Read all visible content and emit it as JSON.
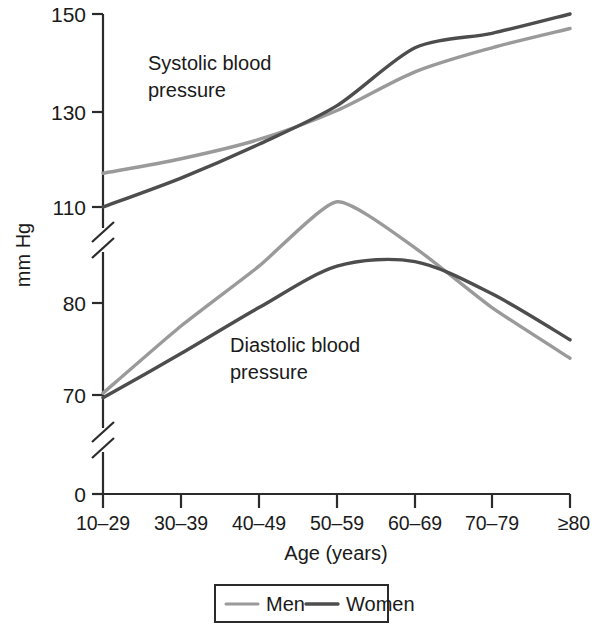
{
  "chart_data": {
    "type": "line",
    "title": "",
    "xlabel": "Age (years)",
    "ylabel": "mm Hg",
    "grid": false,
    "legend_position": "bottom-center",
    "categories": [
      "10–29",
      "30–39",
      "40–49",
      "50–59",
      "60–69",
      "70–79",
      "≥80"
    ],
    "y_tick_labels": [
      "150",
      "130",
      "110",
      "80",
      "70",
      "0"
    ],
    "y_ticks": [
      150,
      130,
      110,
      80,
      70,
      0
    ],
    "axis_breaks": 2,
    "annotations": [
      {
        "text": "Systolic blood pressure",
        "line1": "Systolic blood",
        "line2": "pressure"
      },
      {
        "text": "Diastolic blood pressure",
        "line1": "Diastolic blood",
        "line2": "pressure"
      }
    ],
    "panels": [
      {
        "name": "Systolic blood pressure",
        "series": [
          {
            "name": "Men",
            "color": "#9a9a9a",
            "values": [
              117,
              120,
              124,
              130,
              138,
              143,
              147
            ]
          },
          {
            "name": "Women",
            "color": "#4d4d4d",
            "values": [
              110,
              116,
              123,
              131,
              143,
              146,
              150
            ]
          }
        ]
      },
      {
        "name": "Diastolic blood pressure",
        "series": [
          {
            "name": "Men",
            "color": "#9a9a9a",
            "values": [
              70.2,
              77.5,
              84,
              91,
              86,
              79.5,
              74
            ]
          },
          {
            "name": "Women",
            "color": "#4d4d4d",
            "values": [
              69.7,
              74.5,
              79.5,
              84,
              84.5,
              81,
              76
            ]
          }
        ]
      }
    ],
    "legend": [
      {
        "label": "Men",
        "color": "#9a9a9a"
      },
      {
        "label": "Women",
        "color": "#4d4d4d"
      }
    ],
    "colors": {
      "men": "#9a9a9a",
      "women": "#4d4d4d",
      "axis": "#2b2b2b",
      "text": "#1a1a1a"
    }
  },
  "axis": {
    "y_title": "mm Hg",
    "x_title": "Age (years)",
    "ticks_y": [
      "150",
      "130",
      "110",
      "80",
      "70",
      "0"
    ],
    "ticks_x": [
      "10–29",
      "30–39",
      "40–49",
      "50–59",
      "60–69",
      "70–79",
      "≥80"
    ]
  },
  "labels": {
    "systolic_l1": "Systolic blood",
    "systolic_l2": "pressure",
    "diastolic_l1": "Diastolic blood",
    "diastolic_l2": "pressure"
  },
  "legend": {
    "men": "Men",
    "women": "Women"
  }
}
